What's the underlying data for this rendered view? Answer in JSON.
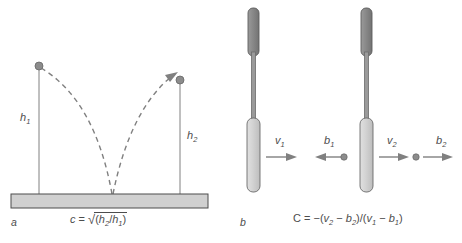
{
  "figure": {
    "type": "scientific-diagram"
  },
  "panel_a": {
    "letter": "a",
    "labels": {
      "h1": "h",
      "h1_sub": "1",
      "h2": "h",
      "h2_sub": "2"
    },
    "formula": {
      "lhs": "c",
      "equals": " = ",
      "radical": "√",
      "open": "(",
      "num": "h",
      "num_sub": "2",
      "slash": "/",
      "den": "h",
      "den_sub": "1",
      "close": ")"
    },
    "elements": {
      "ground_label": "ground-bar",
      "ball_left": "ball-drop-start",
      "ball_right": "ball-rebound-end",
      "path_down": "dashed-fall-path",
      "path_up": "dashed-rebound-path"
    }
  },
  "panel_b": {
    "letter": "b",
    "arrows": [
      {
        "name": "v1",
        "sym": "v",
        "sub": "1",
        "direction": "right"
      },
      {
        "name": "b1",
        "sym": "b",
        "sub": "1",
        "direction": "left"
      },
      {
        "name": "v2",
        "sym": "v",
        "sub": "2",
        "direction": "right"
      },
      {
        "name": "b2",
        "sym": "b",
        "sub": "2",
        "direction": "right"
      }
    ],
    "formula": {
      "lhs": "C",
      "equals": " = ",
      "minus": "−",
      "open1": "(",
      "v2": "v",
      "v2_sub": "2",
      "dash1": " − ",
      "b2": "b",
      "b2_sub": "2",
      "close1": ")",
      "slash": "/",
      "open2": "(",
      "v1": "v",
      "v1_sub": "1",
      "dash2": " − ",
      "b1": "b",
      "b1_sub": "1",
      "close2": ")"
    },
    "elements": {
      "racket_1": "racket-left",
      "racket_2": "racket-right",
      "ball_1": "ball-impact-1",
      "ball_2": "ball-impact-2"
    }
  },
  "colors": {
    "stroke": "#808080",
    "text": "#4d4d4d",
    "light_fill": "#d0d0d0",
    "dark_fill": "#8c8c8c",
    "outline": "#666666"
  }
}
